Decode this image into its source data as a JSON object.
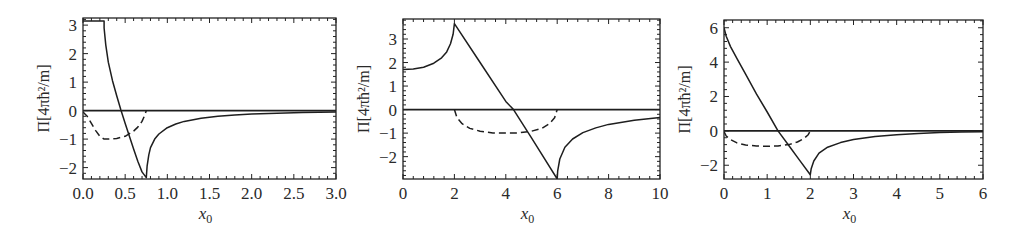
{
  "figure": {
    "panel_count": 3,
    "line_color": "#1e1e1e",
    "frame_color": "#222222"
  },
  "chart_data": [
    {
      "type": "line",
      "title": "",
      "xlabel": "x0",
      "xlabel_main": "x",
      "xlabel_sub": "0",
      "ylabel": "Π[4πħ²/m]",
      "xlim": [
        0.0,
        3.0
      ],
      "ylim": [
        -2.4,
        3.25
      ],
      "xticks": [
        0.0,
        0.5,
        1.0,
        1.5,
        2.0,
        2.5,
        3.0
      ],
      "xtick_labels": [
        "0.0",
        "0.5",
        "1.0",
        "1.5",
        "2.0",
        "2.5",
        "3.0"
      ],
      "yticks": [
        3,
        2,
        1,
        0,
        -1,
        -2
      ],
      "ytick_labels": [
        "3",
        "2",
        "1",
        "0",
        "−1",
        "−2"
      ],
      "grid": false,
      "legend": null,
      "box": {
        "left": 83,
        "top": 18,
        "right": 336,
        "bottom": 179
      },
      "series": [
        {
          "name": "zero-line",
          "style": "solid",
          "x": [
            0,
            3.0
          ],
          "y": [
            0,
            0
          ]
        },
        {
          "name": "Pi-solid",
          "style": "solid",
          "x": [
            0.0,
            0.25,
            0.25,
            0.27,
            0.3,
            0.35,
            0.4,
            0.45,
            0.5,
            0.55,
            0.6,
            0.65,
            0.7,
            0.75,
            0.76,
            0.78,
            0.8,
            0.85,
            0.9,
            1.0,
            1.1,
            1.2,
            1.4,
            1.6,
            1.8,
            2.0,
            2.3,
            2.6,
            3.0
          ],
          "y": [
            3.14,
            3.14,
            2.9,
            2.3,
            1.7,
            1.05,
            0.52,
            0.02,
            -0.45,
            -0.9,
            -1.35,
            -1.78,
            -2.15,
            -2.35,
            -1.95,
            -1.55,
            -1.3,
            -1.0,
            -0.82,
            -0.6,
            -0.47,
            -0.38,
            -0.27,
            -0.2,
            -0.15,
            -0.12,
            -0.09,
            -0.07,
            -0.05
          ]
        },
        {
          "name": "Pi-dashed",
          "style": "dashed",
          "x": [
            0.0,
            0.05,
            0.1,
            0.15,
            0.2,
            0.25,
            0.3,
            0.4,
            0.5,
            0.6,
            0.65,
            0.7,
            0.73,
            0.75
          ],
          "y": [
            -0.05,
            -0.2,
            -0.45,
            -0.7,
            -0.9,
            -1.0,
            -1.0,
            -0.98,
            -0.9,
            -0.72,
            -0.58,
            -0.38,
            -0.18,
            0.0
          ]
        }
      ]
    },
    {
      "type": "line",
      "title": "",
      "xlabel": "x0",
      "xlabel_main": "x",
      "xlabel_sub": "0",
      "ylabel": "Π[4πħ²/m]",
      "xlim": [
        0,
        10
      ],
      "ylim": [
        -2.95,
        3.85
      ],
      "xticks": [
        0,
        2,
        4,
        6,
        8,
        10
      ],
      "xtick_labels": [
        "0",
        "2",
        "4",
        "6",
        "8",
        "10"
      ],
      "yticks": [
        3,
        2,
        1,
        0,
        -1,
        -2
      ],
      "ytick_labels": [
        "3",
        "2",
        "1",
        "0",
        "−1",
        "−2"
      ],
      "grid": false,
      "legend": null,
      "box": {
        "left": 403,
        "top": 19,
        "right": 660,
        "bottom": 179
      },
      "series": [
        {
          "name": "zero-line",
          "style": "solid",
          "x": [
            0,
            10
          ],
          "y": [
            0,
            0
          ]
        },
        {
          "name": "Pi-solid",
          "style": "solid",
          "x": [
            0.0,
            0.4,
            0.8,
            1.2,
            1.5,
            1.7,
            1.85,
            1.95,
            2.0,
            3.0,
            4.0,
            4.3,
            5.0,
            6.0,
            6.02,
            6.1,
            6.3,
            6.6,
            7.0,
            7.5,
            8.0,
            9.0,
            10.0
          ],
          "y": [
            1.7,
            1.72,
            1.8,
            1.97,
            2.2,
            2.45,
            2.8,
            3.2,
            3.65,
            2.0,
            0.35,
            0.0,
            -1.2,
            -2.95,
            -2.6,
            -2.1,
            -1.6,
            -1.25,
            -0.98,
            -0.78,
            -0.63,
            -0.45,
            -0.33
          ]
        },
        {
          "name": "Pi-dashed",
          "style": "dashed",
          "x": [
            2.0,
            2.1,
            2.3,
            2.6,
            3.0,
            3.5,
            4.0,
            4.5,
            5.0,
            5.4,
            5.7,
            5.9,
            6.0
          ],
          "y": [
            0.0,
            -0.35,
            -0.6,
            -0.8,
            -0.92,
            -0.99,
            -1.0,
            -0.99,
            -0.92,
            -0.8,
            -0.6,
            -0.35,
            0.0
          ]
        }
      ]
    },
    {
      "type": "line",
      "title": "",
      "xlabel": "x0",
      "xlabel_main": "x",
      "xlabel_sub": "0",
      "ylabel": "Π[4πħ²/m]",
      "xlim": [
        0,
        6
      ],
      "ylim": [
        -2.8,
        6.45
      ],
      "xticks": [
        0,
        1,
        2,
        3,
        4,
        5,
        6
      ],
      "xtick_labels": [
        "0",
        "1",
        "2",
        "3",
        "4",
        "5",
        "6"
      ],
      "yticks": [
        6,
        4,
        2,
        0,
        -2
      ],
      "ytick_labels": [
        "6",
        "4",
        "2",
        "0",
        "−2"
      ],
      "grid": false,
      "legend": null,
      "box": {
        "left": 724,
        "top": 20,
        "right": 983,
        "bottom": 179
      },
      "series": [
        {
          "name": "zero-line",
          "style": "solid",
          "x": [
            0,
            6
          ],
          "y": [
            0,
            0
          ]
        },
        {
          "name": "Pi-solid",
          "style": "solid",
          "x": [
            0.0,
            0.05,
            0.15,
            0.3,
            0.5,
            0.75,
            1.0,
            1.25,
            1.5,
            1.75,
            2.0,
            2.02,
            2.08,
            2.2,
            2.4,
            2.7,
            3.0,
            3.5,
            4.0,
            4.5,
            5.0,
            5.5,
            6.0
          ],
          "y": [
            6.0,
            5.5,
            4.9,
            4.2,
            3.3,
            2.15,
            1.1,
            0.0,
            -0.85,
            -1.7,
            -2.55,
            -2.2,
            -1.75,
            -1.3,
            -0.95,
            -0.68,
            -0.5,
            -0.33,
            -0.22,
            -0.15,
            -0.1,
            -0.07,
            -0.05
          ]
        },
        {
          "name": "Pi-dashed",
          "style": "dashed",
          "x": [
            0.0,
            0.05,
            0.15,
            0.3,
            0.5,
            0.75,
            1.0,
            1.25,
            1.5,
            1.7,
            1.85,
            1.95,
            2.0
          ],
          "y": [
            -0.05,
            -0.3,
            -0.5,
            -0.7,
            -0.82,
            -0.88,
            -0.9,
            -0.88,
            -0.8,
            -0.65,
            -0.45,
            -0.22,
            0.0
          ]
        }
      ]
    }
  ]
}
